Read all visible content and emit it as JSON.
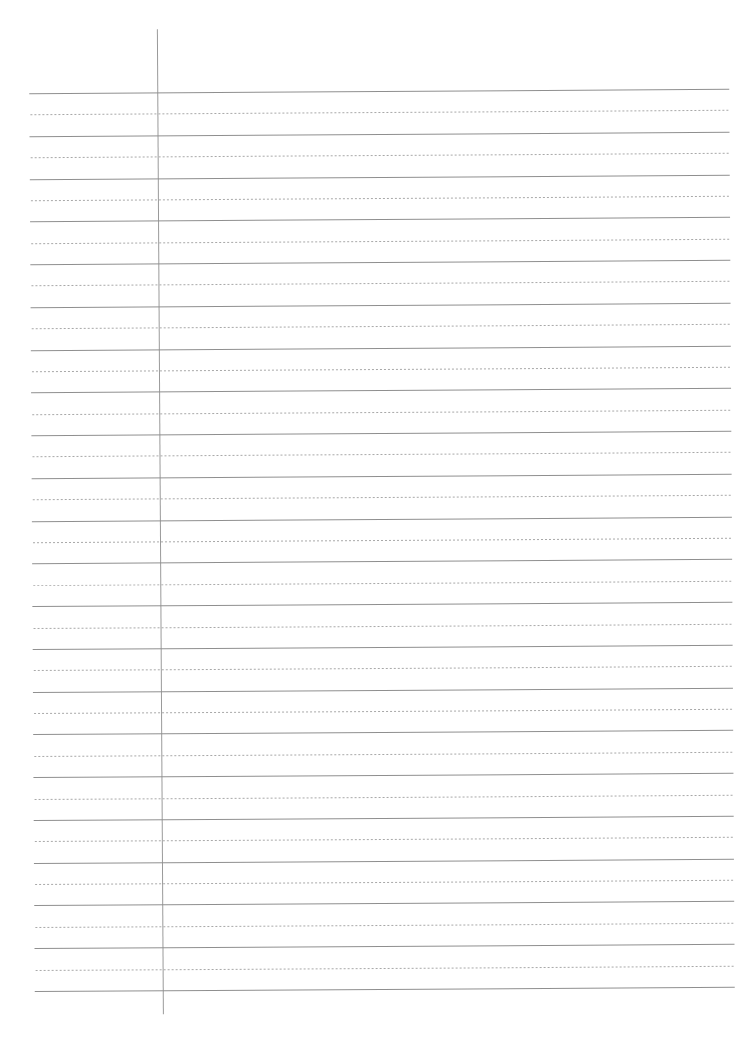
{
  "page": {
    "type": "lined-paper-template",
    "background": "#ffffff",
    "line_color_solid": "#8f8f8f",
    "line_color_dotted": "#a8a8a8",
    "margin_line_color": "#9a9a9a",
    "solid_line_count": 22,
    "dotted_line_count": 21,
    "line_spacing_px": 42.76,
    "first_line_y": 91,
    "left_x": 32,
    "width": 700,
    "margin_x": 160,
    "margin_top": 28,
    "margin_height": 985
  }
}
